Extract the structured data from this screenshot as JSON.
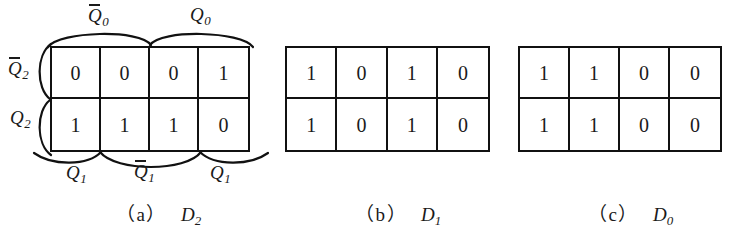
{
  "figure": {
    "background_color": "#ffffff",
    "line_color": "#111111",
    "text_color": "#1a1a1a"
  },
  "maps": [
    {
      "id": "a",
      "function": "D",
      "function_sub": "2",
      "caption_tag": "（a）",
      "rows": [
        {
          "row_label": "Q2bar",
          "values": [
            "0",
            "0",
            "0",
            "1"
          ]
        },
        {
          "row_label": "Q2",
          "values": [
            "1",
            "1",
            "1",
            "0"
          ]
        }
      ],
      "top_labels": [
        {
          "base": "Q",
          "sub": "0",
          "overbar": true,
          "span": "columns-1-2"
        },
        {
          "base": "Q",
          "sub": "0",
          "overbar": false,
          "span": "columns-3-4"
        }
      ],
      "left_labels": [
        {
          "base": "Q",
          "sub": "2",
          "overbar": true,
          "span": "row-1"
        },
        {
          "base": "Q",
          "sub": "2",
          "overbar": false,
          "span": "row-2"
        }
      ],
      "bottom_labels": [
        {
          "base": "Q",
          "sub": "1",
          "overbar": false,
          "span": "column-1"
        },
        {
          "base": "Q",
          "sub": "1",
          "overbar": true,
          "span": "columns-2-3"
        },
        {
          "base": "Q",
          "sub": "1",
          "overbar": false,
          "span": "column-4"
        }
      ]
    },
    {
      "id": "b",
      "function": "D",
      "function_sub": "1",
      "caption_tag": "（b）",
      "rows": [
        {
          "row_label": "Q2bar",
          "values": [
            "1",
            "0",
            "1",
            "0"
          ]
        },
        {
          "row_label": "Q2",
          "values": [
            "1",
            "0",
            "1",
            "0"
          ]
        }
      ],
      "top_labels": [],
      "left_labels": [],
      "bottom_labels": []
    },
    {
      "id": "c",
      "function": "D",
      "function_sub": "0",
      "caption_tag": "（c）",
      "rows": [
        {
          "row_label": "Q2bar",
          "values": [
            "1",
            "1",
            "0",
            "0"
          ]
        },
        {
          "row_label": "Q2",
          "values": [
            "1",
            "1",
            "0",
            "0"
          ]
        }
      ],
      "top_labels": [],
      "left_labels": [],
      "bottom_labels": []
    }
  ],
  "labels": {
    "q_base": "Q",
    "sub_0": "0",
    "sub_1": "1",
    "sub_2": "2"
  }
}
